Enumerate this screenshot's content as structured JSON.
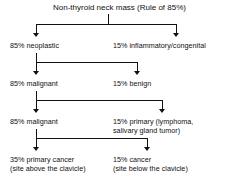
{
  "diagram": {
    "title": "Non-thyroid neck mass (Rule of 85%)",
    "levels": [
      {
        "left": {
          "label": "85% neoplastic"
        },
        "right": {
          "label": "15% inflammatory/congenital"
        }
      },
      {
        "left": {
          "label": "85% malignant"
        },
        "right": {
          "label": "15% benign"
        }
      },
      {
        "left": {
          "label": "85% malignant"
        },
        "right": {
          "label": "15% primary (lymphoma,",
          "label2": "salivary gland tumor)"
        }
      },
      {
        "left": {
          "label": "35% primary cancer",
          "label2": "(site above the clavicle)"
        },
        "right": {
          "label": "15% cancer",
          "label2": "(site below the clavicle)"
        }
      }
    ],
    "colors": {
      "background": "#ffffff",
      "text": "#111111",
      "connector": "#111111"
    }
  }
}
